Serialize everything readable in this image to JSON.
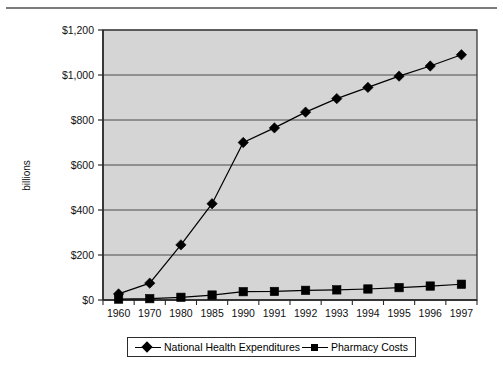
{
  "figure": {
    "ylabel": "billions"
  },
  "chart_data": {
    "type": "line",
    "title": "",
    "subtitle": "",
    "xlabel": "",
    "ylabel": "billions",
    "categories": [
      "1960",
      "1970",
      "1980",
      "1985",
      "1990",
      "1991",
      "1992",
      "1993",
      "1994",
      "1995",
      "1996",
      "1997"
    ],
    "ylim": [
      0,
      1200
    ],
    "ytick_values": [
      0,
      200,
      400,
      600,
      800,
      1000,
      1200
    ],
    "ytick_labels": [
      "$0",
      "$200",
      "$400",
      "$600",
      "$800",
      "$1,000",
      "$1,200"
    ],
    "grid": "horizontal",
    "legend_position": "bottom",
    "plot_background": "#d5d5d5",
    "series": [
      {
        "name": "National Health Expenditures",
        "marker": "diamond",
        "color": "#000000",
        "values": [
          27,
          75,
          245,
          428,
          700,
          765,
          835,
          895,
          945,
          995,
          1040,
          1090
        ]
      },
      {
        "name": "Pharmacy Costs",
        "marker": "square",
        "color": "#000000",
        "values": [
          4,
          6,
          12,
          22,
          37,
          38,
          43,
          45,
          49,
          55,
          62,
          70
        ]
      }
    ]
  },
  "legend": {
    "entries": [
      {
        "label": "National Health Expenditures",
        "marker": "diamond"
      },
      {
        "label": "Pharmacy Costs",
        "marker": "square"
      }
    ]
  }
}
